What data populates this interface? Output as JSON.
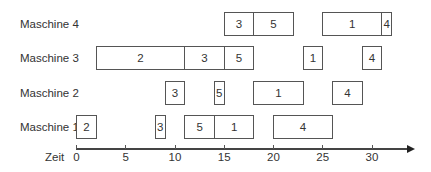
{
  "chart_data": {
    "type": "gantt",
    "title": "",
    "xlabel": "Zeit",
    "ylabel": "",
    "xlim": [
      0,
      34
    ],
    "x_ticks": [
      0,
      5,
      10,
      15,
      20,
      25,
      30
    ],
    "grid": false,
    "rows": [
      {
        "name": "Maschine 4",
        "tasks": [
          {
            "label": "3",
            "start": 15,
            "end": 18
          },
          {
            "label": "5",
            "start": 18,
            "end": 22
          },
          {
            "label": "1",
            "start": 25,
            "end": 31
          },
          {
            "label": "4",
            "start": 31,
            "end": 32
          }
        ]
      },
      {
        "name": "Maschine 3",
        "tasks": [
          {
            "label": "2",
            "start": 2,
            "end": 11
          },
          {
            "label": "3",
            "start": 11,
            "end": 15
          },
          {
            "label": "5",
            "start": 15,
            "end": 18
          },
          {
            "label": "1",
            "start": 23,
            "end": 25
          },
          {
            "label": "4",
            "start": 29,
            "end": 31
          }
        ]
      },
      {
        "name": "Maschine 2",
        "tasks": [
          {
            "label": "3",
            "start": 9,
            "end": 11
          },
          {
            "label": "5",
            "start": 14,
            "end": 15
          },
          {
            "label": "1",
            "start": 18,
            "end": 23
          },
          {
            "label": "4",
            "start": 26,
            "end": 29
          }
        ]
      },
      {
        "name": "Maschine 1",
        "tasks": [
          {
            "label": "2",
            "start": 0,
            "end": 2
          },
          {
            "label": "3",
            "start": 8,
            "end": 9
          },
          {
            "label": "5",
            "start": 11,
            "end": 14
          },
          {
            "label": "1",
            "start": 14,
            "end": 18
          },
          {
            "label": "4",
            "start": 20,
            "end": 26
          }
        ]
      }
    ]
  },
  "colors": {
    "border": "#555555",
    "fill": "#ffffff",
    "text": "#333333",
    "axis": "#444444"
  }
}
